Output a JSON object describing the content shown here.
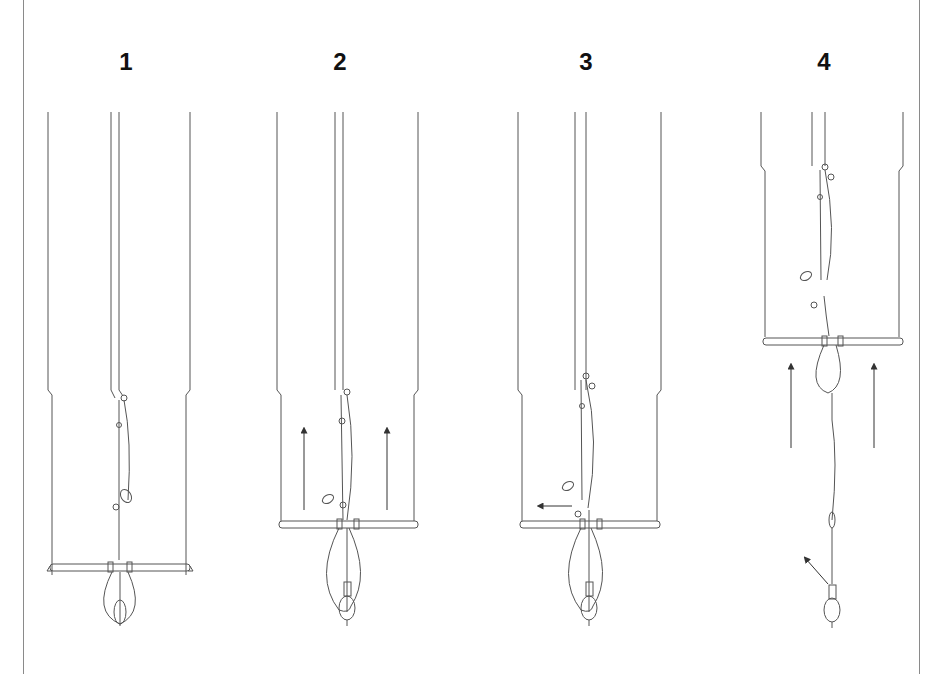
{
  "figure": {
    "type": "step-by-step line illustration",
    "steps": [
      {
        "label": "1",
        "description": "Bar at lowest position, chicken loop with donkey dick hanging below bar"
      },
      {
        "label": "2",
        "description": "Bar pushed up along center line",
        "arrows": [
          "up",
          "up"
        ]
      },
      {
        "label": "3",
        "description": "Safety release pulled sideways",
        "arrows": [
          "left"
        ]
      },
      {
        "label": "4",
        "description": "Bar released upward, leash line extended",
        "arrows": [
          "up",
          "up",
          "up-left"
        ]
      }
    ]
  },
  "colors": {
    "line": "#555555",
    "label": "#111111",
    "border": "#8a8a8a",
    "background": "#ffffff"
  }
}
